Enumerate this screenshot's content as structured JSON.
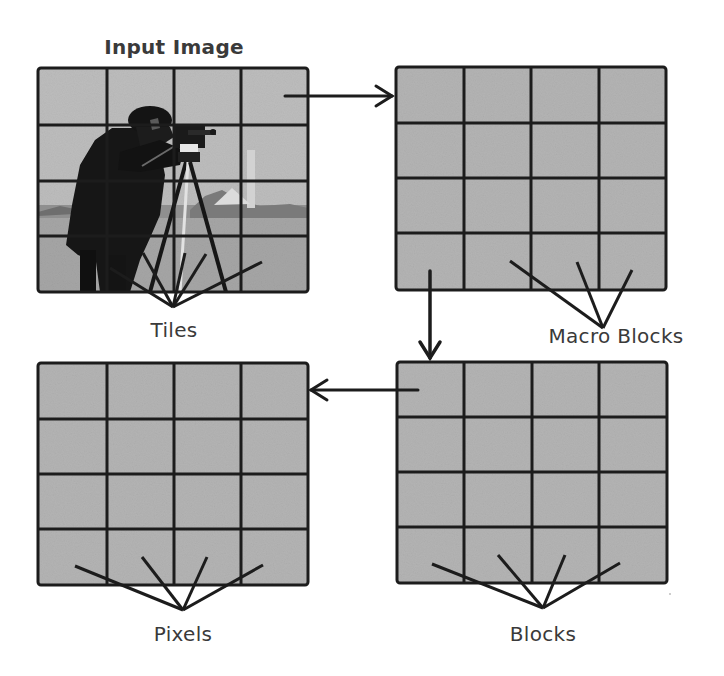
{
  "diagram": {
    "colors": {
      "background": "#ffffff",
      "cell_fill": "#b4b4b4",
      "grid_line": "#1c1c1c",
      "label_text": "#3a3a3a"
    },
    "nodes": [
      {
        "id": "input-image",
        "label": "Input Image",
        "grid": "4x4",
        "content": "cameraman photo"
      },
      {
        "id": "macro-blocks",
        "label": "Macro Blocks",
        "grid": "4x4"
      },
      {
        "id": "blocks",
        "label": "Blocks",
        "grid": "4x4"
      },
      {
        "id": "pixels",
        "label": "Pixels",
        "grid": "4x4"
      }
    ],
    "pointer_labels": {
      "tiles": "Tiles",
      "macro_blocks": "Macro Blocks",
      "blocks": "Blocks",
      "pixels": "Pixels"
    },
    "titles": {
      "input_image": "Input Image"
    },
    "edges": [
      {
        "from": "input-image",
        "to": "macro-blocks",
        "direction": "right"
      },
      {
        "from": "macro-blocks",
        "to": "blocks",
        "direction": "down"
      },
      {
        "from": "blocks",
        "to": "pixels",
        "direction": "left"
      }
    ]
  }
}
